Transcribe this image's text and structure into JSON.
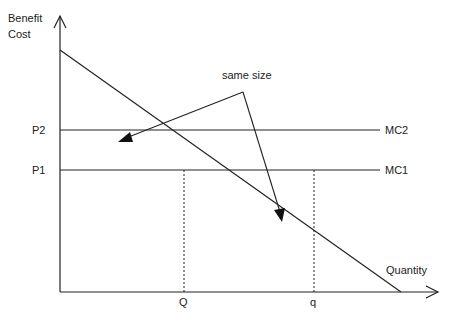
{
  "axes": {
    "y_label_line1": "Benefit",
    "y_label_line2": "Cost",
    "x_label": "Quantity"
  },
  "price_labels": {
    "p2": "P2",
    "p1": "P1"
  },
  "curves": {
    "mc2": "MC2",
    "mc1": "MC1"
  },
  "quantity_labels": {
    "Q": "Q",
    "q": "q"
  },
  "annotation": {
    "text": "same size"
  }
}
